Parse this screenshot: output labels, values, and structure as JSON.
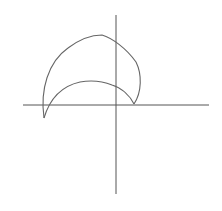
{
  "diagram": {
    "type": "geometric-figure",
    "colors": {
      "background": "#ffffff",
      "axis": "#555555",
      "curve": "#666666"
    },
    "axes": {
      "horizontal": {
        "x1": 23,
        "y1": 105,
        "x2": 209,
        "y2": 105
      },
      "vertical": {
        "x1": 116,
        "y1": 15,
        "x2": 116,
        "y2": 194
      }
    },
    "shape": {
      "left_cusp": {
        "x": 44,
        "y": 118
      },
      "right_point": {
        "x": 134,
        "y": 104
      },
      "outer_arc_path": "M 44 118 C 40 90, 48 62, 68 48 C 80 39, 92 35, 102 35 C 112 38, 126 48, 136 62 C 142 74, 142 92, 134 104",
      "inner_arc_path": "M 134 104 C 130 96, 122 88, 112 85 C 102 81, 92 80, 80 82 C 62 86, 50 98, 44 118"
    }
  }
}
